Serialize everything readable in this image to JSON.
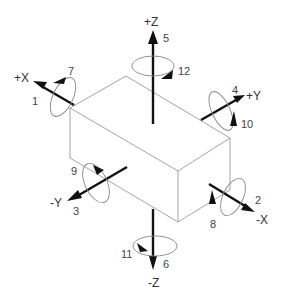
{
  "diagram": {
    "axes": [
      {
        "id": "plus_x",
        "label": "+X",
        "translation_number": "1",
        "rotation_number": "7"
      },
      {
        "id": "minus_x",
        "label": "-X",
        "translation_number": "2",
        "rotation_number": "8"
      },
      {
        "id": "minus_y",
        "label": "-Y",
        "translation_number": "3",
        "rotation_number": "9"
      },
      {
        "id": "plus_y",
        "label": "+Y",
        "translation_number": "4",
        "rotation_number": "10"
      },
      {
        "id": "plus_z",
        "label": "+Z",
        "translation_number": "5",
        "rotation_number": "12"
      },
      {
        "id": "minus_z",
        "label": "-Z",
        "translation_number": "6",
        "rotation_number": "11"
      }
    ],
    "colors": {
      "axis": "#111111",
      "box_edge": "#9a9a9a",
      "rotation_loop": "#888888",
      "text": "#333333"
    }
  }
}
